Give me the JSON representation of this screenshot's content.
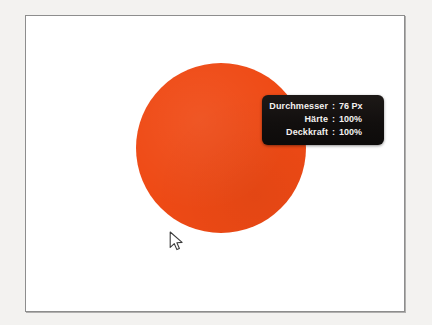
{
  "canvas": {
    "name": "image-canvas",
    "background_color": "#ffffff",
    "border_color": "#8d8d8d",
    "outer_background_color": "#f3f2f0"
  },
  "brush_blob": {
    "name": "brush-stroke",
    "color": "#ef4a15",
    "shape": "circle",
    "diameter_px": 170
  },
  "cursor": {
    "name": "mouse-pointer",
    "type": "arrow"
  },
  "brush_tooltip": {
    "colon": ":",
    "rows": [
      {
        "label": "Durchmesser",
        "value": "76 Px"
      },
      {
        "label": "Härte",
        "value": "100%"
      },
      {
        "label": "Deckkraft",
        "value": "100%"
      }
    ],
    "background_color": "#151211",
    "text_color": "#f4f2f0"
  }
}
